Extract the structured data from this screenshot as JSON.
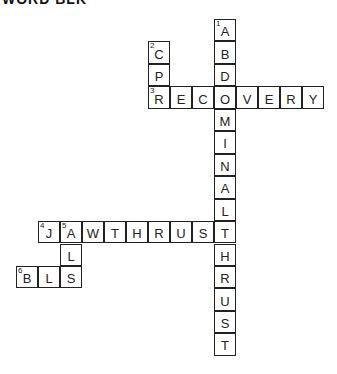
{
  "title": "WORD BLK",
  "grid": {
    "origin_x": 16,
    "origin_y": 19,
    "cell_w": 22,
    "cell_h": 22.45
  },
  "words": [
    {
      "number": "1",
      "direction": "down",
      "answer": "ABDOMINALTHRUST",
      "col": 9,
      "row": 0
    },
    {
      "number": "2",
      "direction": "down",
      "answer": "CPR",
      "col": 6,
      "row": 1
    },
    {
      "number": "3",
      "direction": "across",
      "answer": "RECOVERY",
      "col": 6,
      "row": 3
    },
    {
      "number": "4",
      "direction": "across",
      "answer": "JAWTHRUST",
      "col": 1,
      "row": 9
    },
    {
      "number": "5",
      "direction": "down",
      "answer": "ALS",
      "col": 2,
      "row": 9
    },
    {
      "number": "6",
      "direction": "across",
      "answer": "BLS",
      "col": 0,
      "row": 11
    }
  ]
}
